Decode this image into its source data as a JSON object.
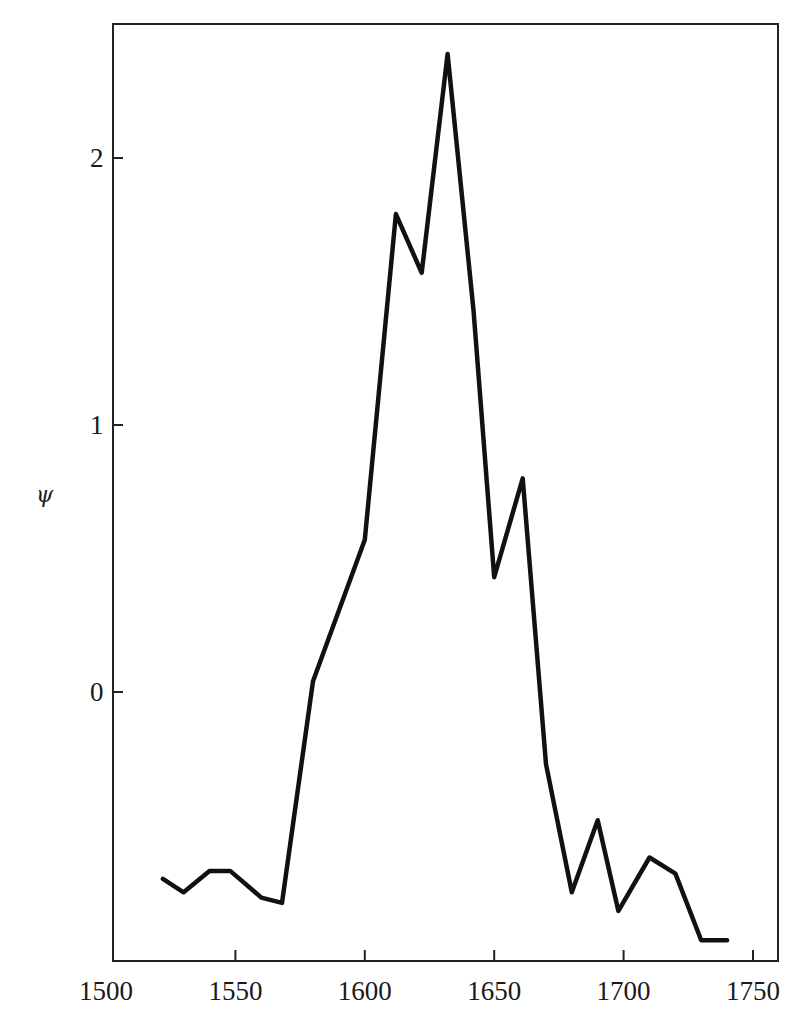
{
  "chart_data": {
    "type": "line",
    "title": "",
    "xlabel": "",
    "ylabel": "ψ",
    "xlim": [
      1500,
      1760
    ],
    "ylim": [
      -1.0,
      2.5
    ],
    "x_ticks": [
      1500,
      1550,
      1600,
      1650,
      1700,
      1750
    ],
    "y_ticks": [
      0,
      1,
      2
    ],
    "grid": false,
    "legend": null,
    "series": [
      {
        "name": "ψ",
        "color": "#111111",
        "x": [
          1522,
          1530,
          1540,
          1548,
          1560,
          1568,
          1580,
          1600,
          1612,
          1622,
          1632,
          1642,
          1650,
          1661,
          1670,
          1680,
          1690,
          1698,
          1710,
          1720,
          1730,
          1740
        ],
        "values": [
          -0.7,
          -0.75,
          -0.67,
          -0.67,
          -0.77,
          -0.79,
          0.04,
          0.57,
          1.79,
          1.57,
          2.39,
          1.43,
          0.43,
          0.8,
          -0.27,
          -0.75,
          -0.48,
          -0.82,
          -0.62,
          -0.68,
          -0.93,
          -0.93
        ]
      }
    ]
  },
  "axes": {
    "y_label": "ψ",
    "x_tick_labels": [
      "1500",
      "1550",
      "1600",
      "1650",
      "1700",
      "1750"
    ],
    "y_tick_labels": [
      "0",
      "1",
      "2"
    ]
  },
  "colors": {
    "line": "#111111",
    "frame": "#222222",
    "background": "#ffffff"
  }
}
